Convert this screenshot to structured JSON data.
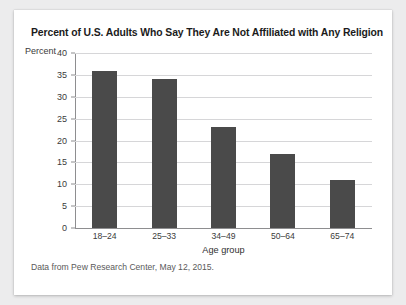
{
  "card": {
    "background_color": "#ffffff",
    "page_background_color": "#ececed"
  },
  "title": "Percent of U.S. Adults Who Say They Are Not Affiliated with Any Religion",
  "axis_unit_label": "Percent",
  "source_note": "Data from Pew Research Center, May 12, 2015.",
  "chart_data": {
    "type": "bar",
    "title": "Percent of U.S. Adults Who Say They Are Not Affiliated with Any Religion",
    "categories": [
      "18–24",
      "25–33",
      "34–49",
      "50–64",
      "65–74"
    ],
    "values": [
      36,
      34,
      23,
      17,
      11
    ],
    "xlabel": "Age group",
    "ylabel": "Percent",
    "ylim": [
      0,
      40
    ],
    "yticks": [
      0,
      5,
      10,
      15,
      20,
      25,
      30,
      35,
      40
    ],
    "ytick_labels": [
      "0",
      "5",
      "10",
      "15",
      "20",
      "25",
      "30",
      "35",
      "40"
    ],
    "grid": true,
    "grid_axis": "y",
    "legend": false,
    "bar_color": "#4a4a4a",
    "gridline_color": "#d6d6d8",
    "axis_color": "#8e8e90"
  }
}
